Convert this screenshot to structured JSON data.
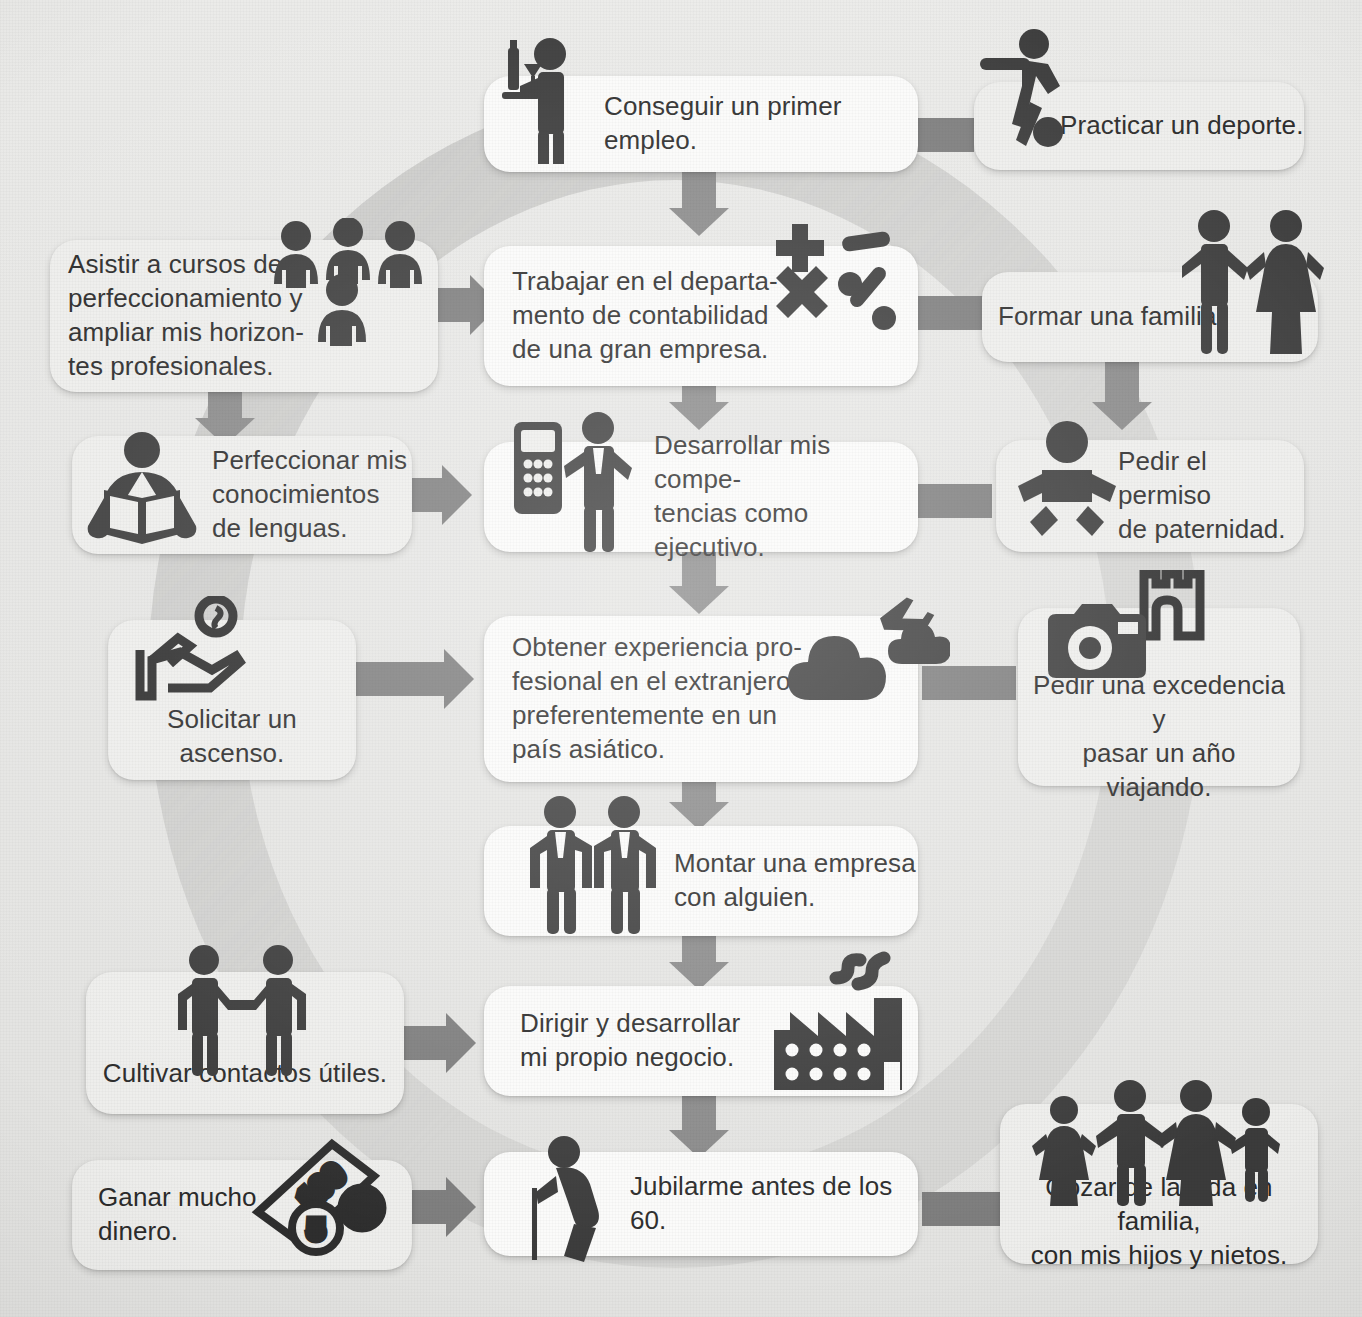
{
  "diagram": {
    "background_color": "#e9e9e7",
    "card_color": "#fbfbfa",
    "arrow_color": "#7d7d7d",
    "ring_color": "#d6d6d4",
    "icon_color": "#3b3b3b"
  },
  "cards": [
    {
      "id": "primer-empleo",
      "text": "Conseguir un primer empleo.",
      "icon": "waiter-tray-icon",
      "column": "center",
      "row": 1
    },
    {
      "id": "deporte",
      "text": "Practicar un deporte.",
      "icon": "soccer-player-icon",
      "column": "right",
      "row": 1
    },
    {
      "id": "cursos",
      "text": "Asistir a cursos de\nperfeccionamiento y\nampliar mis horizon-\ntes profesionales.",
      "icon": "group-of-people-icon",
      "column": "left",
      "row": 2
    },
    {
      "id": "contabilidad",
      "text": "Trabajar en el departa-\nmento de contabilidad\nde una gran empresa.",
      "icon": "math-symbols-icon",
      "column": "center",
      "row": 2
    },
    {
      "id": "familia",
      "text": "Formar una familia.",
      "icon": "couple-icon",
      "column": "right",
      "row": 2
    },
    {
      "id": "lenguas",
      "text": "Perfeccionar mis\nconocimientos\nde lenguas.",
      "icon": "person-reading-book-icon",
      "column": "left",
      "row": 3
    },
    {
      "id": "ejecutivo",
      "text": "Desarrollar mis compe-\ntencias como ejecutivo.",
      "icon": "businessman-phone-icon",
      "column": "center",
      "row": 3
    },
    {
      "id": "paternidad",
      "text": "Pedir el permiso\nde paternidad.",
      "icon": "baby-icon",
      "column": "right",
      "row": 3
    },
    {
      "id": "ascenso",
      "text": "Solicitar un ascenso.",
      "icon": "hand-coin-icon",
      "column": "left",
      "row": 4
    },
    {
      "id": "extranjero",
      "text": "Obtener experiencia pro-\nfesional en el extranjero,\npreferentemente en un\npaís asiático.",
      "icon": "airplane-clouds-icon",
      "column": "center",
      "row": 4
    },
    {
      "id": "excedencia",
      "text": "Pedir una excedencia y\npasar un año viajando.",
      "icon": "camera-castle-icon",
      "column": "right",
      "row": 4
    },
    {
      "id": "empresa",
      "text": "Montar una empresa\ncon alguien.",
      "icon": "two-businessmen-icon",
      "column": "center",
      "row": 5
    },
    {
      "id": "contactos",
      "text": "Cultivar contactos útiles.",
      "icon": "handshake-icon",
      "column": "left",
      "row": 6
    },
    {
      "id": "negocio",
      "text": "Dirigir y desarrollar\nmi propio negocio.",
      "icon": "factory-icon",
      "column": "center",
      "row": 6
    },
    {
      "id": "dinero",
      "text": "Ganar mucho\ndinero.",
      "icon": "banknote-coins-icon",
      "column": "left",
      "row": 7
    },
    {
      "id": "jubilacion",
      "text": "Jubilarme antes de los 60.",
      "icon": "elderly-cane-icon",
      "column": "center",
      "row": 7
    },
    {
      "id": "vida-familia",
      "text": "Gozar de la vida en familia,\ncon mis hijos y nietos.",
      "icon": "family-four-icon",
      "column": "right",
      "row": 7
    }
  ],
  "icon_labels": {
    "banknote_value": "100",
    "coin_value_1": "5",
    "coin_value_2": "2"
  }
}
